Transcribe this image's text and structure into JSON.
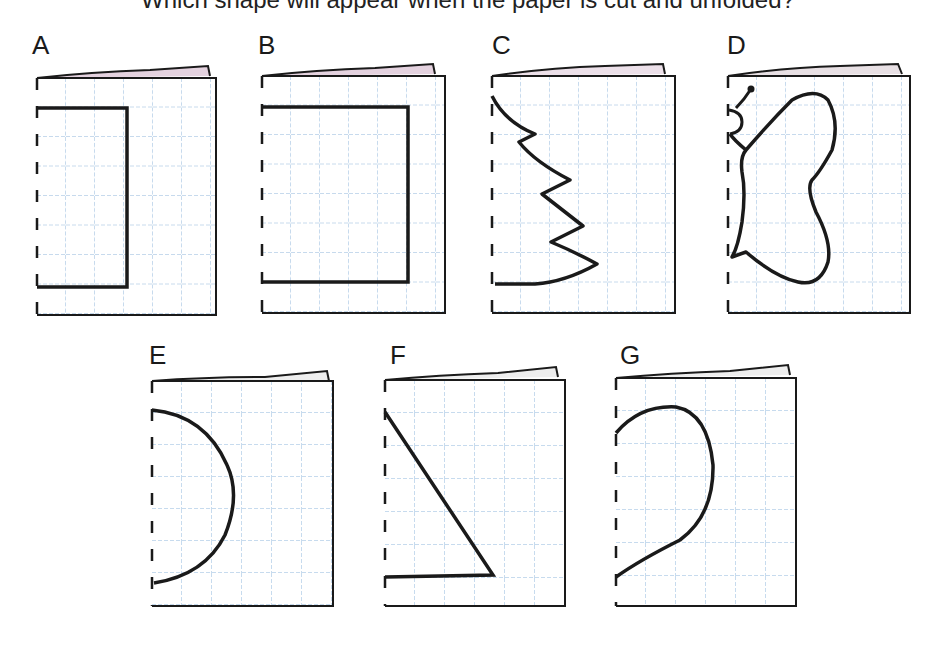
{
  "header": {
    "cutoff_text": "Which shape will appear when the paper is cut and unfolded?"
  },
  "panels": [
    {
      "label": "A",
      "shape": "rectangle-open",
      "description": "Rectangle from fold, 3 cols wide, 6 rows tall"
    },
    {
      "label": "B",
      "shape": "rectangle-open-wide",
      "description": "Rectangle from fold, 5 cols wide, 6 rows tall"
    },
    {
      "label": "C",
      "shape": "zigzag-tree",
      "description": "Zigzag tree half outline"
    },
    {
      "label": "D",
      "shape": "butterfly-half",
      "description": "Butterfly half with antenna"
    },
    {
      "label": "E",
      "shape": "semicircle",
      "description": "Semicircle from fold"
    },
    {
      "label": "F",
      "shape": "right-triangle",
      "description": "Right triangle from fold"
    },
    {
      "label": "G",
      "shape": "heart-half",
      "description": "Heart half outline"
    }
  ],
  "colors": {
    "grid": "#8fb6dc",
    "outline": "#1a1a1a",
    "fold_shade": "#c9a6bf"
  }
}
